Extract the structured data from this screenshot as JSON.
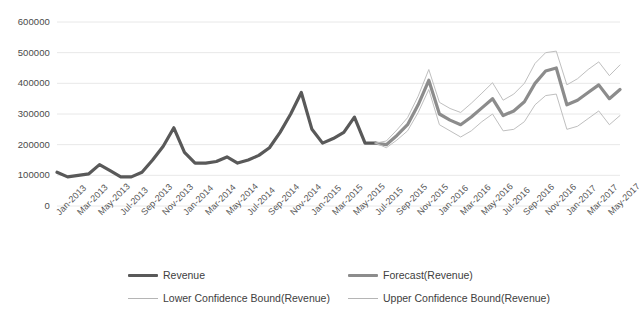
{
  "chart_data": {
    "type": "line",
    "title": "",
    "xlabel": "",
    "ylabel": "",
    "ylim": [
      0,
      600000
    ],
    "ytick_labels": [
      "600000",
      "500000",
      "400000",
      "300000",
      "200000",
      "100000",
      "0"
    ],
    "ytick_values": [
      600000,
      500000,
      400000,
      300000,
      200000,
      100000,
      0
    ],
    "grid": true,
    "legend_position": "bottom",
    "x": [
      "Jan-2013",
      "Feb-2013",
      "Mar-2013",
      "Apr-2013",
      "May-2013",
      "Jun-2013",
      "Jul-2013",
      "Aug-2013",
      "Sep-2013",
      "Oct-2013",
      "Nov-2013",
      "Dec-2013",
      "Jan-2014",
      "Feb-2014",
      "Mar-2014",
      "Apr-2014",
      "May-2014",
      "Jun-2014",
      "Jul-2014",
      "Aug-2014",
      "Sep-2014",
      "Oct-2014",
      "Nov-2014",
      "Dec-2014",
      "Jan-2015",
      "Feb-2015",
      "Mar-2015",
      "Apr-2015",
      "May-2015",
      "Jun-2015",
      "Jul-2015",
      "Aug-2015",
      "Sep-2015",
      "Oct-2015",
      "Nov-2015",
      "Dec-2015",
      "Jan-2016",
      "Feb-2016",
      "Mar-2016",
      "Apr-2016",
      "May-2016",
      "Jun-2016",
      "Jul-2016",
      "Aug-2016",
      "Sep-2016",
      "Oct-2016",
      "Nov-2016",
      "Dec-2016",
      "Jan-2017",
      "Feb-2017",
      "Mar-2017",
      "Apr-2017",
      "May-2017",
      "Jun-2017"
    ],
    "xtick_labels": [
      "Jan-2013",
      "Mar-2013",
      "May-2013",
      "Jul-2013",
      "Sep-2013",
      "Nov-2013",
      "Jan-2014",
      "Mar-2014",
      "May-2014",
      "Jul-2014",
      "Sep-2014",
      "Nov-2014",
      "Jan-2015",
      "Mar-2015",
      "May-2015",
      "Jul-2015",
      "Sep-2015",
      "Nov-2015",
      "Jan-2016",
      "Mar-2016",
      "May-2016",
      "Jul-2016",
      "Sep-2016",
      "Nov-2016",
      "Jan-2017",
      "Mar-2017",
      "May-2017"
    ],
    "series": [
      {
        "name": "Revenue",
        "color": "#595959",
        "width": 3.2,
        "start_index": 0,
        "values": [
          110000,
          95000,
          100000,
          105000,
          135000,
          115000,
          95000,
          95000,
          110000,
          150000,
          195000,
          255000,
          175000,
          140000,
          140000,
          145000,
          160000,
          140000,
          150000,
          165000,
          190000,
          240000,
          300000,
          370000,
          250000,
          205000,
          220000,
          240000,
          290000,
          205000,
          205000,
          null,
          null,
          null,
          null,
          null,
          null,
          null,
          null,
          null,
          null,
          null,
          null,
          null,
          null,
          null,
          null,
          null,
          null,
          null,
          null,
          null,
          null,
          null
        ]
      },
      {
        "name": "Forecast(Revenue)",
        "color": "#8c8c8c",
        "width": 3.2,
        "start_index": 30,
        "values": [
          null,
          null,
          null,
          null,
          null,
          null,
          null,
          null,
          null,
          null,
          null,
          null,
          null,
          null,
          null,
          null,
          null,
          null,
          null,
          null,
          null,
          null,
          null,
          null,
          null,
          null,
          null,
          null,
          null,
          null,
          205000,
          200000,
          230000,
          265000,
          330000,
          410000,
          300000,
          280000,
          265000,
          290000,
          320000,
          350000,
          295000,
          310000,
          340000,
          400000,
          440000,
          450000,
          330000,
          345000,
          370000,
          395000,
          350000,
          380000
        ]
      },
      {
        "name": "Lower Confidence Bound(Revenue)",
        "color": "#bfbfbf",
        "width": 1,
        "start_index": 30,
        "values": [
          null,
          null,
          null,
          null,
          null,
          null,
          null,
          null,
          null,
          null,
          null,
          null,
          null,
          null,
          null,
          null,
          null,
          null,
          null,
          null,
          null,
          null,
          null,
          null,
          null,
          null,
          null,
          null,
          null,
          null,
          205000,
          190000,
          215000,
          245000,
          305000,
          380000,
          265000,
          245000,
          225000,
          245000,
          275000,
          300000,
          245000,
          250000,
          275000,
          330000,
          360000,
          365000,
          250000,
          260000,
          285000,
          310000,
          265000,
          295000
        ]
      },
      {
        "name": "Upper Confidence Bound(Revenue)",
        "color": "#bfbfbf",
        "width": 1,
        "start_index": 30,
        "values": [
          null,
          null,
          null,
          null,
          null,
          null,
          null,
          null,
          null,
          null,
          null,
          null,
          null,
          null,
          null,
          null,
          null,
          null,
          null,
          null,
          null,
          null,
          null,
          null,
          null,
          null,
          null,
          null,
          null,
          null,
          205000,
          212000,
          248000,
          288000,
          358000,
          445000,
          338000,
          318000,
          305000,
          335000,
          368000,
          402000,
          345000,
          365000,
          400000,
          465000,
          500000,
          505000,
          395000,
          415000,
          445000,
          470000,
          425000,
          460000
        ]
      }
    ]
  },
  "legend": {
    "items": [
      {
        "label": "Revenue",
        "style": "thick-dark"
      },
      {
        "label": "Forecast(Revenue)",
        "style": "thick-gray"
      },
      {
        "label": "Lower Confidence Bound(Revenue)",
        "style": "thin"
      },
      {
        "label": "Upper Confidence Bound(Revenue)",
        "style": "thin"
      }
    ]
  },
  "colors": {
    "revenue": "#595959",
    "forecast": "#8c8c8c",
    "bounds": "#bfbfbf",
    "grid": "#e8e8e8",
    "text": "#4a4a4a",
    "background": "#ffffff"
  }
}
